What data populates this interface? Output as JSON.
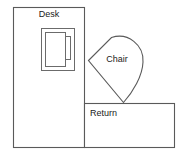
{
  "diagram": {
    "type": "floor-plan",
    "background_color": "#ffffff",
    "stroke_color": "#5a5a5a",
    "label_color": "#1a1a1a",
    "shapes": [
      {
        "id": "desk",
        "label": "Desk",
        "kind": "rectangle",
        "label_position": "top-center"
      },
      {
        "id": "chair",
        "label": "Chair",
        "kind": "teardrop",
        "label_position": "center"
      },
      {
        "id": "return",
        "label": "Return",
        "kind": "rectangle",
        "label_position": "top-left"
      },
      {
        "id": "computer",
        "label": "",
        "kind": "nested-rectangles",
        "label_position": "none"
      }
    ]
  },
  "labels": {
    "desk": "Desk",
    "chair": "Chair",
    "return": "Return"
  }
}
